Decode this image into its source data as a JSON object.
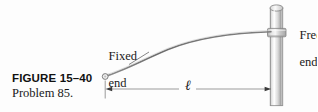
{
  "figure": {
    "canvas": {
      "width": 317,
      "height": 112,
      "background": "#fdfdfd"
    },
    "caption": {
      "figure_number": "FIGURE 15–40",
      "problem": "Problem 85."
    },
    "labels": {
      "fixed_end_line1": "Fixed",
      "fixed_end_line2": "end",
      "free_end_line1": "Free",
      "free_end_line2": "end",
      "length_symbol": "ℓ"
    },
    "colors": {
      "rod_fill_light": "#f2f2f2",
      "rod_fill_mid": "#d9d9d9",
      "rod_fill_dark": "#9e9e9e",
      "rod_outline": "#6e6e6e",
      "curve_stroke": "#6b6b6b",
      "dimension_line": "#7a7a7a",
      "text": "#1a1a1a",
      "background": "#fdfdfd"
    },
    "geometry": {
      "vertical_rod": {
        "name": "vertical-post",
        "x_left": 270,
        "x_right": 283,
        "y_top": 5,
        "y_bottom": 106,
        "cap_ry": 3.2
      },
      "collar": {
        "name": "attachment-collar",
        "x_left": 267,
        "x_right": 286,
        "y_top": 28,
        "y_bottom": 37
      },
      "curved_rod": {
        "name": "flexible-rod",
        "start_x": 105,
        "start_y": 76,
        "end_x": 272,
        "end_y": 32,
        "control1_x": 140,
        "control1_y": 60,
        "control2_x": 205,
        "control2_y": 38
      },
      "pivot": {
        "name": "fixed-end-pivot",
        "cx": 105,
        "cy": 76,
        "r": 2.6
      },
      "dimension_line": {
        "name": "length-dimension",
        "y": 89,
        "x_start": 106,
        "x_end": 271,
        "tick_x": 105,
        "tick_top": 80,
        "tick_bottom": 98
      },
      "leader_fixed_end": {
        "x1": 128,
        "y1": 64,
        "x2": 146,
        "y2": 53
      }
    }
  }
}
